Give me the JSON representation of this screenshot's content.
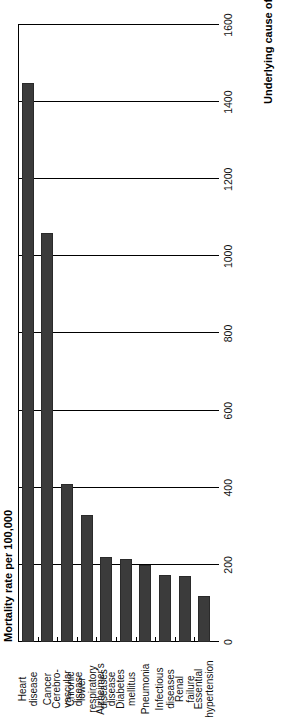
{
  "chart_data": {
    "type": "bar",
    "orientation": "horizontal",
    "title": "",
    "xlabel": "Mortality rate per 100,000",
    "ylabel": "Underlying cause of death",
    "categories": [
      "Heart disease",
      "Cancer",
      "Cerebro-vascular disease",
      "Chronic lower respiratory diseases",
      "Alzheimer's disease",
      "Diabetes mellitus",
      "Pneumonia",
      "Infectious diseases",
      "Renal failure",
      "Essential hypertension"
    ],
    "category_lines": [
      [
        "Heart",
        "disease"
      ],
      [
        "Cancer"
      ],
      [
        "Cerebro-",
        "vascular",
        "disease"
      ],
      [
        "Chronic",
        "lower",
        "respiratory",
        "diseases"
      ],
      [
        "Alzheimer's",
        "disease"
      ],
      [
        "Diabetes",
        "mellitus"
      ],
      [
        "Pneumonia"
      ],
      [
        "Infectious",
        "diseases"
      ],
      [
        "Renal",
        "failure"
      ],
      [
        "Essential",
        "hypertension"
      ]
    ],
    "values": [
      1450,
      1060,
      410,
      330,
      220,
      215,
      200,
      175,
      170,
      120
    ],
    "xlim": [
      0,
      1600
    ],
    "xticks": [
      0,
      200,
      400,
      600,
      800,
      1000,
      1200,
      1400,
      1600
    ],
    "xtick_labels": [
      "0",
      "200",
      "400",
      "600",
      "800",
      "1000",
      "1200",
      "1400",
      "1600"
    ],
    "grid": true,
    "grid_axis": "x",
    "legend": null,
    "bar_color": "#3b3b3b",
    "axis_color": "#000000",
    "background": "#ffffff"
  }
}
